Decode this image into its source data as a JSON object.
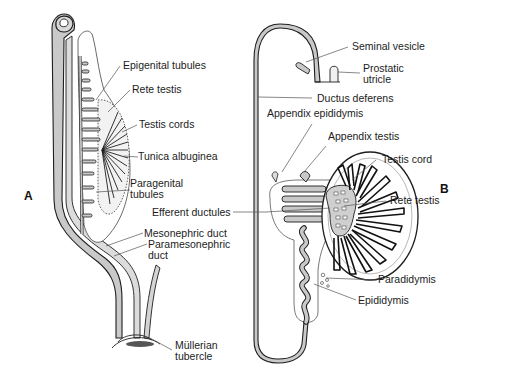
{
  "figure": {
    "colors": {
      "duct_fill": "#c9c9c9",
      "outline": "#1e1e1e",
      "leader": "#555555",
      "background": "#ffffff"
    },
    "panels": [
      {
        "id": "A",
        "label": "A",
        "labels": [
          {
            "text": "Epigenital tubules"
          },
          {
            "text": "Rete testis"
          },
          {
            "text": "Testis cords"
          },
          {
            "text": "Tunica albuginea"
          },
          {
            "text": "Paragenital",
            "text2": "tubules"
          },
          {
            "text": "Mesonephric duct"
          },
          {
            "text": "Paramesonephric",
            "text2": "duct"
          },
          {
            "text": "Müllerian",
            "text2": "tubercle"
          }
        ]
      },
      {
        "id": "B",
        "label": "B",
        "labels": [
          {
            "text": "Seminal vesicle"
          },
          {
            "text": "Prostatic",
            "text2": "utricle"
          },
          {
            "text": "Ductus deferens"
          },
          {
            "text": "Appendix epididymis"
          },
          {
            "text": "Appendix testis"
          },
          {
            "text": "Testis cord"
          },
          {
            "text": "Efferent ductules"
          },
          {
            "text": "Rete testis"
          },
          {
            "text": "Paradidymis"
          },
          {
            "text": "Epididymis"
          }
        ]
      }
    ]
  }
}
